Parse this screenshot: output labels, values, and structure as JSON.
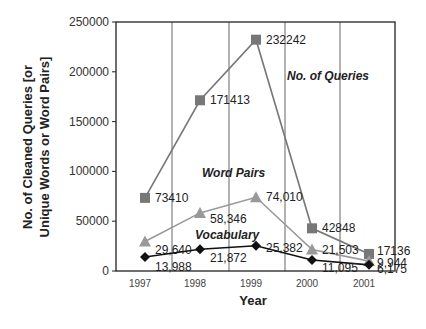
{
  "chart_data": {
    "type": "line",
    "title": "",
    "xlabel": "Year",
    "ylabel": [
      "No. of Cleaned Queries [or",
      "Unique Words or Word Pairs]"
    ],
    "ylim": [
      0,
      250000
    ],
    "yticks": [
      "0",
      "50000",
      "100000",
      "150000",
      "200000",
      "250000"
    ],
    "categories": [
      "1997",
      "1998",
      "1999",
      "2000",
      "2001"
    ],
    "grid": "vertical",
    "legend": "inline labels",
    "series": [
      {
        "name": "No. of Queries",
        "marker": "square",
        "color": "#777777",
        "values": [
          73410,
          171413,
          232242,
          42848,
          17136
        ],
        "labels": [
          "73410",
          "171413",
          "232242",
          "42848",
          "17136"
        ]
      },
      {
        "name": "Word Pairs",
        "marker": "triangle",
        "color": "#999999",
        "values": [
          29640,
          58346,
          74010,
          21503,
          9944
        ],
        "labels": [
          "29,640",
          "58,346",
          "74,010",
          "21,503",
          "9,944"
        ]
      },
      {
        "name": "Vocabulary",
        "marker": "diamond",
        "color": "#111111",
        "values": [
          13988,
          21872,
          25382,
          11095,
          6175
        ],
        "labels": [
          "13,988",
          "21,872",
          "25,382",
          "11,095",
          "6,175"
        ]
      }
    ]
  }
}
